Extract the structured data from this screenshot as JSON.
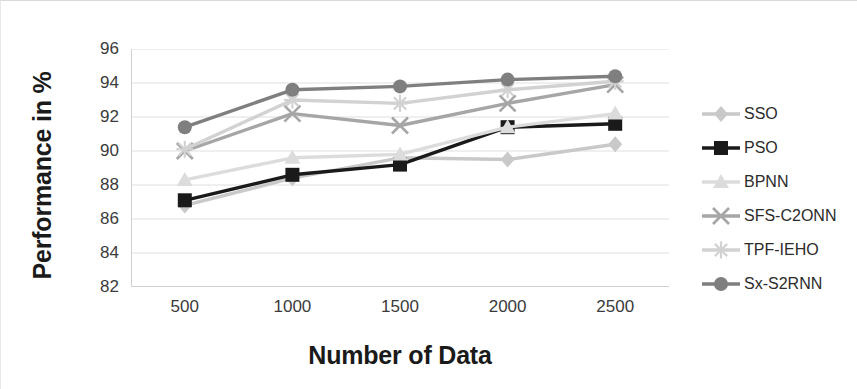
{
  "chart_data": {
    "type": "line",
    "title": "",
    "xlabel": "Number of Data",
    "ylabel": "Performance in %",
    "categories": [
      "500",
      "1000",
      "1500",
      "2000",
      "2500"
    ],
    "x": [
      500,
      1000,
      1500,
      2000,
      2500
    ],
    "ylim": [
      82,
      96
    ],
    "yticks": [
      82,
      84,
      86,
      88,
      90,
      92,
      94,
      96
    ],
    "ytick_labels": [
      "82",
      "84",
      "86",
      "88",
      "90",
      "92",
      "94",
      "96"
    ],
    "grid": true,
    "legend_position": "right",
    "series": [
      {
        "name": "SSO",
        "marker": "diamond",
        "color": "#c9c9c9",
        "values": [
          86.8,
          88.4,
          89.6,
          89.5,
          90.4
        ]
      },
      {
        "name": "PSO",
        "marker": "square",
        "color": "#1a1a1a",
        "values": [
          87.1,
          88.6,
          89.2,
          91.4,
          91.6
        ]
      },
      {
        "name": "BPNN",
        "marker": "triangle",
        "color": "#dcdcdc",
        "values": [
          88.3,
          89.6,
          89.8,
          91.4,
          92.2
        ]
      },
      {
        "name": "SFS-C2ONN",
        "marker": "x",
        "color": "#a6a6a6",
        "values": [
          90.0,
          92.2,
          91.5,
          92.8,
          93.9
        ]
      },
      {
        "name": "TPF-IEHO",
        "marker": "star",
        "color": "#d2d2d2",
        "values": [
          90.1,
          93.0,
          92.8,
          93.6,
          94.1
        ]
      },
      {
        "name": "Sx-S2RNN",
        "marker": "circle",
        "color": "#7f7f7f",
        "values": [
          91.4,
          93.6,
          93.8,
          94.2,
          94.4
        ]
      }
    ]
  },
  "axes": {
    "y_title": "Performance in %",
    "x_title": "Number of Data"
  },
  "colors": {
    "grid": "#dfdfdf",
    "axis": "#d0d0d0",
    "text": "#3b3b3b"
  }
}
